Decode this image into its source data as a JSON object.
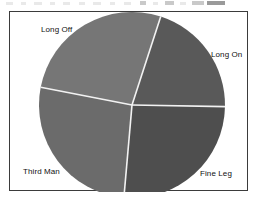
{
  "chart_data": {
    "type": "pie",
    "title": "",
    "subtitle": "",
    "xlabel": "",
    "ylabel": "",
    "grid": false,
    "legend_position": "none",
    "labels_position": "outside",
    "categories": [
      "Long On",
      "Fine Leg",
      "Third Man",
      "Long Off"
    ],
    "values": [
      20,
      26,
      27,
      27
    ],
    "unit": "percent",
    "slices": [
      {
        "label": "Long On",
        "value": 20,
        "percent": 20,
        "color": "#595959",
        "start_angle_deg": 18,
        "end_angle_deg": 91,
        "label_x": 201,
        "label_y": 38
      },
      {
        "label": "Fine Leg",
        "value": 26,
        "percent": 26,
        "color": "#4e4e4e",
        "start_angle_deg": 91,
        "end_angle_deg": 185,
        "label_x": 190,
        "label_y": 157
      },
      {
        "label": "Third Man",
        "value": 27,
        "percent": 27,
        "color": "#6b6b6b",
        "start_angle_deg": 185,
        "end_angle_deg": 281,
        "label_x": 13,
        "label_y": 155
      },
      {
        "label": "Long Off",
        "value": 27,
        "percent": 27,
        "color": "#767676",
        "start_angle_deg": 281,
        "end_angle_deg": 378,
        "label_x": 31,
        "label_y": 13
      }
    ],
    "geometry": {
      "center_x": 122,
      "center_y": 93,
      "radius": 93,
      "separator_color": "#f2f2f2",
      "separator_width": 1.6
    },
    "frame": {
      "border_color": "#3b3b3b",
      "background_color": "#ffffff"
    }
  }
}
